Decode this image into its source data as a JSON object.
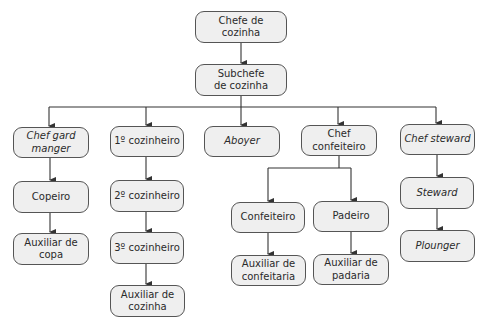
{
  "diagram": {
    "type": "org-chart",
    "nodes": {
      "chefe": {
        "label": "Chefe de\ncozinha"
      },
      "subchefe": {
        "label": "Subchefe\nde cozinha"
      },
      "gard_manger": {
        "label": "Chef gard\nmanger",
        "italic": true
      },
      "copeiro": {
        "label": "Copeiro"
      },
      "aux_copa": {
        "label": "Auxiliar de\ncopa"
      },
      "cozinheiro1": {
        "label": "1º cozinheiro"
      },
      "cozinheiro2": {
        "label": "2º cozinheiro"
      },
      "cozinheiro3": {
        "label": "3º cozinheiro"
      },
      "aux_cozinha": {
        "label": "Auxiliar de\ncozinha"
      },
      "aboyer": {
        "label": "Aboyer",
        "italic": true
      },
      "chef_confeiteiro": {
        "label": "Chef\nconfeiteiro"
      },
      "confeiteiro": {
        "label": "Confeiteiro"
      },
      "aux_confeitaria": {
        "label": "Auxiliar de\nconfeitaria"
      },
      "padeiro": {
        "label": "Padeiro"
      },
      "aux_padaria": {
        "label": "Auxiliar de\npadaria"
      },
      "chef_steward": {
        "label": "Chef steward",
        "italic": true
      },
      "steward": {
        "label": "Steward",
        "italic": true
      },
      "plounger": {
        "label": "Plounger",
        "italic": true
      }
    },
    "edges": [
      [
        "chefe",
        "subchefe"
      ],
      [
        "subchefe",
        "gard_manger"
      ],
      [
        "subchefe",
        "cozinheiro1"
      ],
      [
        "subchefe",
        "aboyer"
      ],
      [
        "subchefe",
        "chef_confeiteiro"
      ],
      [
        "subchefe",
        "chef_steward"
      ],
      [
        "gard_manger",
        "copeiro"
      ],
      [
        "copeiro",
        "aux_copa"
      ],
      [
        "cozinheiro1",
        "cozinheiro2"
      ],
      [
        "cozinheiro2",
        "cozinheiro3"
      ],
      [
        "cozinheiro3",
        "aux_cozinha"
      ],
      [
        "chef_confeiteiro",
        "confeiteiro"
      ],
      [
        "chef_confeiteiro",
        "padeiro"
      ],
      [
        "confeiteiro",
        "aux_confeitaria"
      ],
      [
        "padeiro",
        "aux_padaria"
      ],
      [
        "chef_steward",
        "steward"
      ],
      [
        "steward",
        "plounger"
      ]
    ],
    "colors": {
      "box_fill": "#efefef",
      "box_border": "#555555",
      "line": "#333333",
      "text": "#2a2a2a"
    }
  }
}
